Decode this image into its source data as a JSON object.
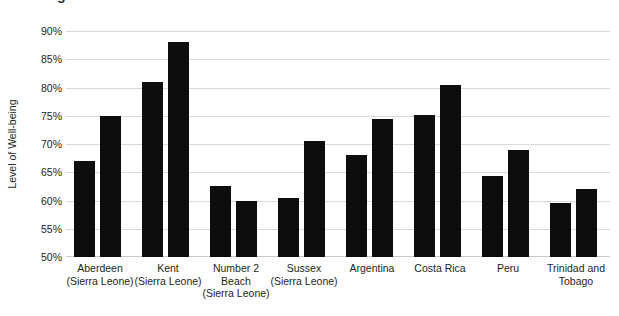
{
  "chart": {
    "title": "Wellbeing of local communities",
    "ylabel": "Level of Well-being"
  },
  "chart_data": {
    "type": "bar",
    "title": "Wellbeing of local communities",
    "xlabel": "",
    "ylabel": "Level of Well-being",
    "ylim": [
      50,
      90
    ],
    "ytick_labels": [
      "90%",
      "85%",
      "80%",
      "75%",
      "70%",
      "65%",
      "60%",
      "55%",
      "50%"
    ],
    "ytick_values": [
      90,
      85,
      80,
      75,
      70,
      65,
      60,
      55,
      50
    ],
    "grid": "horizontal",
    "legend": "none",
    "bar_color": "#0d0d0d",
    "categories": [
      "Aberdeen (Sierra Leone)",
      "Kent (Sierra Leone)",
      "Number 2 Beach (Sierra Leone)",
      "Sussex (Sierra Leone)",
      "Argentina",
      "Costa Rica",
      "Peru",
      "Trinidad and Tobago"
    ],
    "category_lines": [
      [
        "Aberdeen",
        "(Sierra Leone)"
      ],
      [
        "Kent",
        "(Sierra Leone)"
      ],
      [
        "Number 2",
        "Beach",
        "(Sierra Leone)"
      ],
      [
        "Sussex",
        "(Sierra Leone)"
      ],
      [
        "Argentina"
      ],
      [
        "Costa Rica"
      ],
      [
        "Peru"
      ],
      [
        "Trinidad and",
        "Tobago"
      ]
    ],
    "series": [
      {
        "name": "Series 1",
        "values": [
          67.0,
          81.0,
          62.5,
          60.5,
          68.0,
          75.2,
          64.3,
          59.5
        ]
      },
      {
        "name": "Series 2",
        "values": [
          75.0,
          88.0,
          60.0,
          70.5,
          74.5,
          80.5,
          69.0,
          62.0
        ]
      }
    ]
  }
}
